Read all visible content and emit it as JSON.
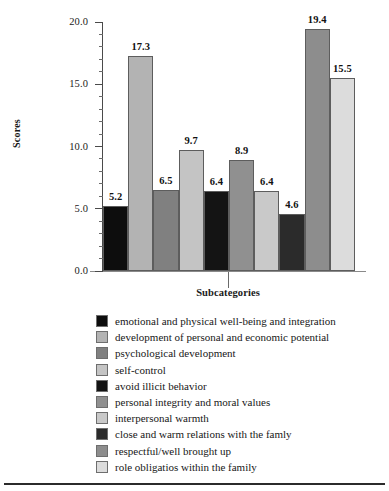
{
  "chart_data": {
    "type": "bar",
    "title": "",
    "xlabel": "Subcategories",
    "ylabel": "Scores",
    "ylim": [
      0,
      20
    ],
    "ytick_labels": [
      "0.0",
      "5.0",
      "10.0",
      "15.0",
      "20.0"
    ],
    "ytick_values": [
      0,
      5,
      10,
      15,
      20
    ],
    "minor_ticks_per_interval": 4,
    "grid": false,
    "legend_position": "below",
    "categories": [
      "emotional and physical well-being and integration",
      "development of personal and economic potential",
      "psychological development",
      "self-control",
      "avoid illicit behavior",
      "personal integrity and moral values",
      "interpersonal warmth",
      "close and warm relations with the famly",
      "respectful/well brought up",
      "role obligatios within the family"
    ],
    "values": [
      5.2,
      17.3,
      6.5,
      9.7,
      6.4,
      8.9,
      6.4,
      4.6,
      19.4,
      15.5
    ],
    "value_labels": [
      "5.2",
      "17.3",
      "6.5",
      "9.7",
      "6.4",
      "8.9",
      "6.4",
      "4.6",
      "19.4",
      "15.5"
    ],
    "bar_colors": [
      "#0d0d0d",
      "#b3b3b3",
      "#808080",
      "#c4c4c4",
      "#141414",
      "#909090",
      "#c9c9c9",
      "#2b2b2b",
      "#8d8d8d",
      "#dcdcdc"
    ],
    "bar_edge_color": "#5d5d5d",
    "axis_color": "#4a4a4a"
  },
  "legend": {
    "items": [
      {
        "label": "emotional and physical well-being and integration",
        "color": "#0d0d0d"
      },
      {
        "label": "development of personal and economic potential",
        "color": "#b3b3b3"
      },
      {
        "label": "psychological development",
        "color": "#808080"
      },
      {
        "label": "self-control",
        "color": "#c4c4c4"
      },
      {
        "label": "avoid illicit behavior",
        "color": "#141414"
      },
      {
        "label": "personal integrity and moral values",
        "color": "#909090"
      },
      {
        "label": "interpersonal warmth",
        "color": "#c9c9c9"
      },
      {
        "label": "close and warm relations with the famly",
        "color": "#2b2b2b"
      },
      {
        "label": "respectful/well brought up",
        "color": "#8d8d8d"
      },
      {
        "label": "role obligatios within the family",
        "color": "#dcdcdc"
      }
    ]
  }
}
